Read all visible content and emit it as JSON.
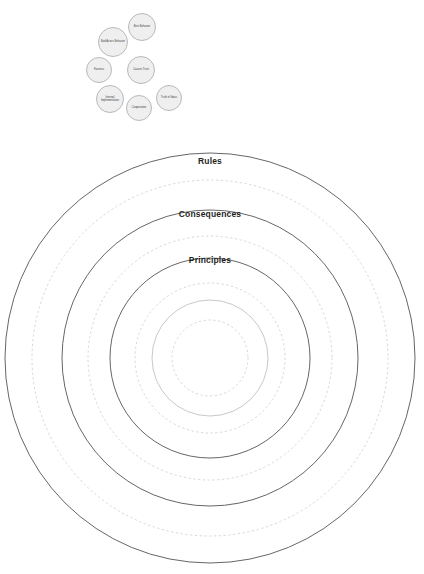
{
  "diagram": {
    "colors": {
      "ring_solid": "#555555",
      "ring_solid_faint": "#b0b0b0",
      "ring_dashed": "#d8d8d8",
      "node_fill": "#efefef",
      "node_stroke": "#b9b9b9",
      "label_text": "#1f1f1f",
      "background": "#ffffff"
    },
    "node_cluster": {
      "nodes": [
        {
          "id": "node-1",
          "label": "Bad Actors Behavior",
          "cx": 113,
          "cy": 42,
          "r": 15
        },
        {
          "id": "node-2",
          "label": "Best Behavior",
          "cx": 142,
          "cy": 27,
          "r": 14
        },
        {
          "id": "node-3",
          "label": "Fairness",
          "cx": 99,
          "cy": 70,
          "r": 13
        },
        {
          "id": "node-4",
          "label": "Causes Trust",
          "cx": 141,
          "cy": 70,
          "r": 14
        },
        {
          "id": "node-5",
          "label": "Internal Implementation",
          "cx": 110,
          "cy": 99,
          "r": 14
        },
        {
          "id": "node-6",
          "label": "Cooperation",
          "cx": 139,
          "cy": 108,
          "r": 13
        },
        {
          "id": "node-7",
          "label": "Truth of Ideas",
          "cx": 169,
          "cy": 98,
          "r": 13
        }
      ]
    },
    "concentric": {
      "center_x": 210,
      "center_y": 358,
      "rings": [
        {
          "id": "ring-outer-solid",
          "radius": 205,
          "style": "solid",
          "weight": "strong",
          "label": "Rules"
        },
        {
          "id": "ring-dashed-1",
          "radius": 178,
          "style": "dashed",
          "weight": "light",
          "label": ""
        },
        {
          "id": "ring-mid-solid",
          "radius": 148,
          "style": "solid",
          "weight": "strong",
          "label": "Consequences"
        },
        {
          "id": "ring-dashed-2",
          "radius": 122,
          "style": "dashed",
          "weight": "light",
          "label": ""
        },
        {
          "id": "ring-inner-solid",
          "radius": 100,
          "style": "solid",
          "weight": "strong",
          "label": "Principles"
        },
        {
          "id": "ring-dashed-3",
          "radius": 75,
          "style": "dashed",
          "weight": "light",
          "label": ""
        },
        {
          "id": "ring-core-solid",
          "radius": 58,
          "style": "solid",
          "weight": "faint",
          "label": ""
        },
        {
          "id": "ring-core-dashed",
          "radius": 38,
          "style": "dashed",
          "weight": "light",
          "label": ""
        }
      ],
      "labels": [
        {
          "id": "label-rules",
          "text": "Rules",
          "x": 210,
          "y": 156
        },
        {
          "id": "label-consequences",
          "text": "Consequences",
          "x": 210,
          "y": 209
        },
        {
          "id": "label-principles",
          "text": "Principles",
          "x": 210,
          "y": 255
        }
      ]
    }
  }
}
